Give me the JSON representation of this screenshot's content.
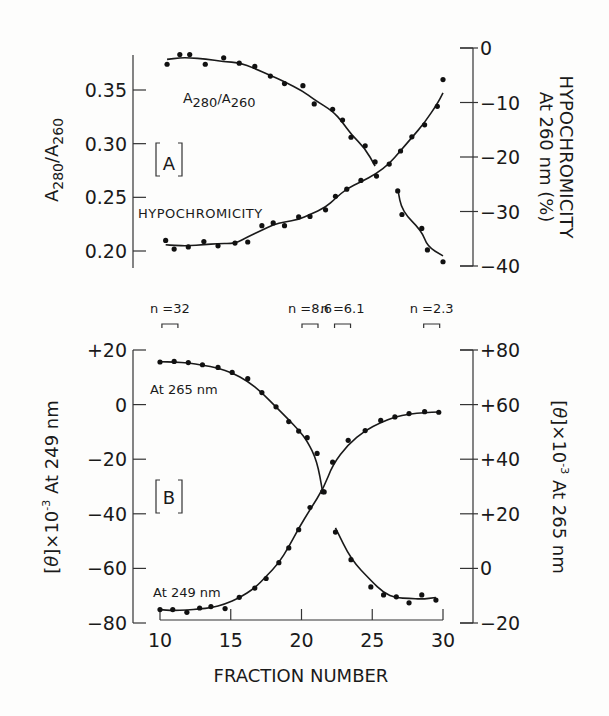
{
  "chart_data": [
    {
      "panel": "A",
      "type": "scatter",
      "panel_label": "[A]",
      "xlabel": "FRACTION NUMBER",
      "x_ticks": [
        10,
        15,
        20,
        25,
        30
      ],
      "xlim": [
        10,
        30
      ],
      "left_axis": {
        "label": "A280/A260",
        "ticks": [
          "0.20",
          "0.25",
          "0.30",
          "0.35"
        ],
        "tick_values": [
          0.2,
          0.25,
          0.3,
          0.35
        ],
        "ylim": [
          0.185,
          0.385
        ]
      },
      "right_axis": {
        "label_line1": "HYPOCHROMICITY",
        "label_line2": "At 260 nm (%)",
        "ticks": [
          "0",
          "−10",
          "−20",
          "−30",
          "−40"
        ],
        "tick_values": [
          0,
          -10,
          -20,
          -30,
          -40
        ],
        "ylim": [
          -40,
          0
        ]
      },
      "series": [
        {
          "name": "A280/A260",
          "axis": "left",
          "annotation": "A280/A260",
          "x": [
            10.5,
            11.4,
            12.1,
            13.2,
            14.5,
            15.6,
            16.7,
            17.8,
            18.8,
            20.1,
            20.9,
            22.2,
            22.9,
            23.5,
            24.5,
            25.2,
            26.8,
            27.1,
            28.5,
            28.9,
            30.0
          ],
          "values": [
            0.374,
            0.383,
            0.383,
            0.374,
            0.38,
            0.375,
            0.372,
            0.363,
            0.356,
            0.354,
            0.337,
            0.332,
            0.322,
            0.306,
            0.298,
            0.283,
            0.256,
            0.234,
            0.221,
            0.201,
            0.19
          ]
        },
        {
          "name": "Hypochromicity",
          "axis": "right",
          "annotation": "HYPOCHROMICITY",
          "x": [
            10.4,
            11.0,
            12.0,
            13.1,
            14.1,
            15.3,
            16.2,
            17.2,
            18.0,
            18.8,
            19.8,
            20.6,
            21.7,
            22.4,
            23.2,
            24.2,
            25.3,
            26.2,
            27.0,
            27.8,
            28.7,
            29.6,
            30.0
          ],
          "values": [
            -35.3,
            -36.9,
            -36.5,
            -35.5,
            -36.3,
            -35.8,
            -35.6,
            -32.6,
            -32.1,
            -32.6,
            -31.0,
            -30.9,
            -29.7,
            -27.2,
            -25.9,
            -24.3,
            -23.5,
            -21.3,
            -18.9,
            -16.3,
            -14.1,
            -10.7,
            -5.8
          ]
        }
      ]
    },
    {
      "panel": "B",
      "type": "scatter",
      "panel_label": "[B]",
      "xlabel": "FRACTION NUMBER",
      "x_ticks": [
        10,
        15,
        20,
        25,
        30
      ],
      "xlim": [
        10,
        30
      ],
      "left_axis": {
        "label": "[θ] × 10⁻³ At 249 nm",
        "ticks": [
          "+20",
          "0",
          "−20",
          "−40",
          "−60",
          "−80"
        ],
        "tick_values": [
          20,
          0,
          -20,
          -40,
          -60,
          -80
        ],
        "ylim": [
          -80,
          20
        ]
      },
      "right_axis": {
        "label": "[θ] × 10⁻³ At 265 nm",
        "ticks": [
          "+80",
          "+60",
          "+40",
          "+20",
          "0",
          "−20"
        ],
        "tick_values": [
          80,
          60,
          40,
          20,
          0,
          -20
        ],
        "ylim": [
          -20,
          80
        ]
      },
      "series": [
        {
          "name": "At 265 nm",
          "axis": "right",
          "annotation": "At 265 nm",
          "x": [
            10.0,
            11.0,
            12.0,
            13.0,
            14.1,
            15.1,
            16.2,
            17.2,
            18.2,
            19.1,
            19.8,
            20.4,
            21.1,
            21.5,
            22.4,
            23.5,
            24.9,
            25.8,
            26.7,
            27.6,
            28.5,
            29.5
          ],
          "values": [
            75.6,
            75.8,
            75.4,
            74.6,
            73.6,
            71.8,
            69.5,
            64.4,
            59.2,
            53.8,
            50.3,
            47.9,
            42.1,
            28.1,
            13.3,
            3.2,
            -6.8,
            -9.7,
            -10.4,
            -12.6,
            -9.7,
            -11.6
          ]
        },
        {
          "name": "At 249 nm",
          "axis": "left",
          "annotation": "At 249 nm",
          "x": [
            10.0,
            10.9,
            11.9,
            12.8,
            13.6,
            14.6,
            15.6,
            16.7,
            17.5,
            18.4,
            19.1,
            19.8,
            20.6,
            21.6,
            22.2,
            23.3,
            24.5,
            25.6,
            26.6,
            27.6,
            28.7,
            29.7
          ],
          "values": [
            -75.1,
            -75.1,
            -76.1,
            -74.5,
            -74.0,
            -74.7,
            -70.6,
            -67.2,
            -63.7,
            -57.9,
            -52.5,
            -45.8,
            -37.7,
            -32.0,
            -21.1,
            -13.1,
            -9.5,
            -5.8,
            -4.5,
            -3.3,
            -2.6,
            -2.8
          ]
        }
      ]
    }
  ],
  "figure": {
    "panel_a_label": "A",
    "panel_b_label": "B",
    "a_left_axis_title": "A280/A260",
    "a_right_axis_title_1": "HYPOCHROMICITY",
    "a_right_axis_title_2": "At 260 nm (%)",
    "a_curve1_label_main": "A",
    "a_curve1_label_sub1": "280",
    "a_curve1_label_slash": "/A",
    "a_curve1_label_sub2": "260",
    "a_curve2_label": "HYPOCHROMICITY",
    "b_curve1_label": "At 265 nm",
    "b_curve2_label": "At 249 nm",
    "b_left_axis_title": "At 249 nm",
    "b_right_axis_title": "At 265 nm",
    "theta_symbol": "θ",
    "times_ten": "×10",
    "exponent": "-3",
    "x_axis_title": "FRACTION NUMBER",
    "n_labels": [
      {
        "text": "n =32",
        "fraction": 10.7
      },
      {
        "text": "n =8.6",
        "fraction": 20.6
      },
      {
        "text": "n =6.1",
        "fraction": 22.9
      },
      {
        "text": "n =2.3",
        "fraction": 29.2
      }
    ]
  }
}
